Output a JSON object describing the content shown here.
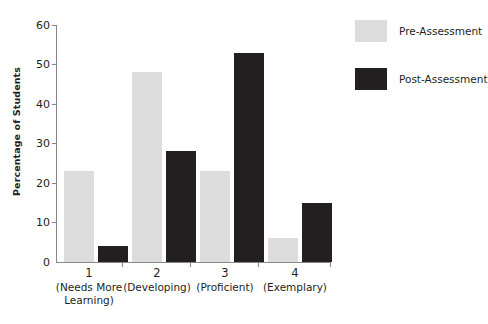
{
  "chart_data": {
    "type": "bar",
    "title": "",
    "xlabel": "",
    "ylabel": "Percentage of Students",
    "ylim": [
      0,
      60
    ],
    "yticks": [
      0,
      10,
      20,
      30,
      40,
      50,
      60
    ],
    "grid": false,
    "legend_position": "right",
    "categories": [
      "1\n(Needs More Learning)",
      "2\n(Developing)",
      "3\n(Proficient)",
      "4\n(Exemplary)"
    ],
    "category_numbers": [
      "1",
      "2",
      "3",
      "4"
    ],
    "category_descriptions": [
      "(Needs More Learning)",
      "(Developing)",
      "(Proficient)",
      "(Exemplary)"
    ],
    "series": [
      {
        "name": "Pre-Assessment",
        "color": "#dcdcdc",
        "values": [
          23,
          48,
          23,
          6
        ]
      },
      {
        "name": "Post-Assessment",
        "color": "#231f20",
        "values": [
          4,
          28,
          53,
          15
        ]
      }
    ]
  },
  "axis": {
    "y_title": "Percentage of Students",
    "y_tick_labels": [
      "60",
      "50",
      "40",
      "30",
      "20",
      "10",
      "0"
    ]
  },
  "legend": {
    "items": [
      {
        "label": "Pre-Assessment",
        "swatch": "legend-swatch-pre"
      },
      {
        "label": "Post-Assessment",
        "swatch": "legend-swatch-post"
      }
    ]
  },
  "categories": [
    {
      "num": "1",
      "desc_line1": "(Needs More",
      "desc_line2": "Learning)"
    },
    {
      "num": "2",
      "desc_line1": "(Developing)",
      "desc_line2": ""
    },
    {
      "num": "3",
      "desc_line1": "(Proficient)",
      "desc_line2": ""
    },
    {
      "num": "4",
      "desc_line1": "(Exemplary)",
      "desc_line2": ""
    }
  ]
}
